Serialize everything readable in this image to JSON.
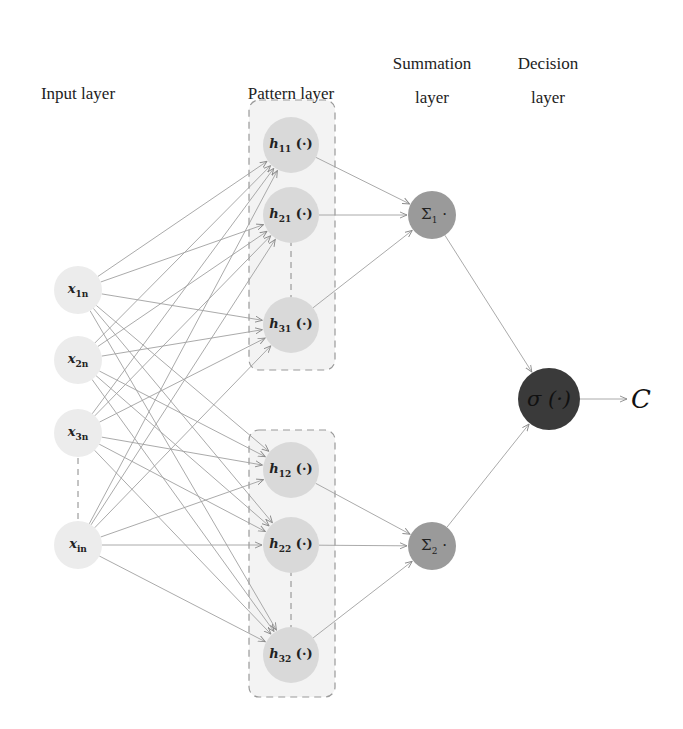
{
  "headers": {
    "input": "Input layer",
    "pattern": "Pattern layer",
    "summation_1": "Summation",
    "summation_2": "layer",
    "decision_1": "Decision",
    "decision_2": "layer"
  },
  "input_nodes": [
    {
      "base": "x",
      "sub": "1n"
    },
    {
      "base": "x",
      "sub": "2n"
    },
    {
      "base": "x",
      "sub": "3n"
    },
    {
      "base": "x",
      "sub": "in"
    }
  ],
  "pattern_nodes": [
    {
      "base": "h",
      "sub": "11",
      "arg": "(·)"
    },
    {
      "base": "h",
      "sub": "21",
      "arg": "(·)"
    },
    {
      "base": "h",
      "sub": "31",
      "arg": "(·)"
    },
    {
      "base": "h",
      "sub": "12",
      "arg": "(·)"
    },
    {
      "base": "h",
      "sub": "22",
      "arg": "(·)"
    },
    {
      "base": "h",
      "sub": "32",
      "arg": "(·)"
    }
  ],
  "summation_nodes": [
    {
      "base": "Σ",
      "sub": "1",
      "suffix": "·"
    },
    {
      "base": "Σ",
      "sub": "2",
      "suffix": "·"
    }
  ],
  "decision_node": {
    "label": "σ (·)"
  },
  "output": {
    "label": "C"
  },
  "colors": {
    "input_fill": "#ececec",
    "pattern_fill": "#d9d9d9",
    "pattern_box_fill": "#f3f3f3",
    "summation_fill": "#9a9a9a",
    "decision_fill": "#3a3a3a",
    "edge": "#9a9a9a"
  }
}
